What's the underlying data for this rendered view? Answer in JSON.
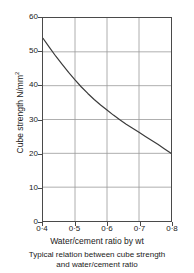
{
  "chart_data": {
    "type": "line",
    "title": "",
    "caption_line_1": "Typical relation between cube strength",
    "caption_line_2": "and water/cement ratio",
    "xlabel": "Water/cement ratio by wt",
    "ylabel_text": "Cube strength N/mm",
    "ylabel_exponent": "2",
    "xlim": [
      0.4,
      0.8
    ],
    "ylim": [
      0,
      60
    ],
    "grid": true,
    "legend": "none",
    "xticks": [
      0.4,
      0.5,
      0.6,
      0.7,
      0.8
    ],
    "xtick_labels": [
      "0·4",
      "0·5",
      "0·6",
      "0·7",
      "0·8"
    ],
    "yticks": [
      0,
      10,
      20,
      30,
      40,
      50,
      60
    ],
    "ytick_labels": [
      "0",
      "10",
      "20",
      "30",
      "40",
      "50",
      "60"
    ],
    "series": [
      {
        "name": "cube strength vs water/cement ratio",
        "color": "#3a3a3a",
        "x": [
          0.4,
          0.42,
          0.44,
          0.46,
          0.48,
          0.5,
          0.52,
          0.54,
          0.56,
          0.58,
          0.6,
          0.62,
          0.64,
          0.66,
          0.68,
          0.7,
          0.72,
          0.74,
          0.76,
          0.78,
          0.8
        ],
        "y": [
          54.0,
          51.3,
          48.7,
          46.3,
          43.9,
          41.7,
          39.6,
          37.7,
          35.9,
          34.3,
          32.8,
          31.3,
          29.9,
          28.6,
          27.4,
          26.2,
          25.0,
          23.8,
          22.6,
          21.3,
          20.0
        ]
      }
    ],
    "axis_color": "#4a4a4a",
    "grid_color": "#9a9a9a",
    "background": "#ffffff"
  },
  "figure": {
    "name": "cube-strength-vs-water-cement-ratio-chart"
  }
}
